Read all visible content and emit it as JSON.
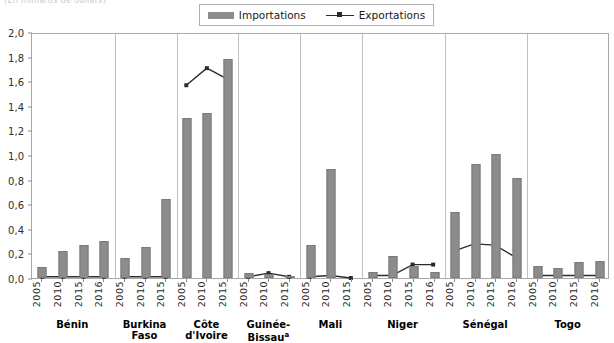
{
  "caption_remnant": "(En milliards de dollars)",
  "legend": {
    "position": "top-center",
    "entries": [
      {
        "label": "Importations",
        "marker": "bar-swatch",
        "color": "#8c8c8c"
      },
      {
        "label": "Exportations",
        "marker": "line-with-square-marker",
        "color": "#2b2b2b"
      }
    ]
  },
  "chart_data": {
    "type": "bar",
    "title": "",
    "subtitle": "",
    "xlabel": "",
    "ylabel": "",
    "ylim": [
      0,
      2.0
    ],
    "ytick_labels": [
      "0,0",
      "0,2",
      "0,4",
      "0,6",
      "0,8",
      "1,0",
      "1,2",
      "1,4",
      "1,6",
      "1,8",
      "2,0"
    ],
    "ytick_values": [
      0,
      0.2,
      0.4,
      0.6,
      0.8,
      1.0,
      1.2,
      1.4,
      1.6,
      1.8,
      2.0
    ],
    "grid": false,
    "decimal_separator": ",",
    "series": [
      {
        "name": "Importations",
        "type": "bar",
        "color": "#8c8c8c"
      },
      {
        "name": "Exportations",
        "type": "line",
        "color": "#2b2b2b"
      }
    ],
    "groups": [
      {
        "country": "Bénin",
        "footnote": "",
        "categories": [
          "2005",
          "2010",
          "2015",
          "2016"
        ],
        "importations": [
          0.09,
          0.22,
          0.27,
          0.3
        ],
        "exportations": [
          0.01,
          0.01,
          0.01,
          0.01
        ]
      },
      {
        "country": "Burkina Faso",
        "footnote": "",
        "categories": [
          "2005",
          "2010",
          "2015"
        ],
        "importations": [
          0.16,
          0.25,
          0.64
        ],
        "exportations": [
          0.01,
          0.01,
          0.01
        ]
      },
      {
        "country": "Côte d'Ivoire",
        "footnote": "",
        "categories": [
          "2005",
          "2010",
          "2015"
        ],
        "importations": [
          1.3,
          1.34,
          1.78
        ],
        "exportations": [
          1.58,
          1.72,
          1.63
        ]
      },
      {
        "country": "Guinée-Bissau",
        "footnote": "a",
        "categories": [
          "2005",
          "2010",
          "2015"
        ],
        "importations": [
          0.04,
          0.03,
          0.02
        ],
        "exportations": [
          0.01,
          0.04,
          0.01
        ]
      },
      {
        "country": "Mali",
        "footnote": "",
        "categories": [
          "2005",
          "2010",
          "2015"
        ],
        "importations": [
          0.27,
          0.89,
          0.0
        ],
        "exportations": [
          0.01,
          0.02,
          0.0
        ]
      },
      {
        "country": "Niger",
        "footnote": "",
        "categories": [
          "2005",
          "2010",
          "2015",
          "2016"
        ],
        "importations": [
          0.05,
          0.18,
          0.1,
          0.05
        ],
        "exportations": [
          0.02,
          0.02,
          0.11,
          0.11
        ]
      },
      {
        "country": "Sénégal",
        "footnote": "",
        "categories": [
          "2005",
          "2010",
          "2015",
          "2016"
        ],
        "importations": [
          0.54,
          0.93,
          1.01,
          0.81
        ],
        "exportations": [
          0.22,
          0.28,
          0.27,
          0.17
        ]
      },
      {
        "country": "Togo",
        "footnote": "",
        "categories": [
          "2005",
          "2010",
          "2015",
          "2016"
        ],
        "importations": [
          0.1,
          0.08,
          0.13,
          0.14
        ],
        "exportations": [
          0.02,
          0.02,
          0.02,
          0.02
        ]
      }
    ]
  }
}
